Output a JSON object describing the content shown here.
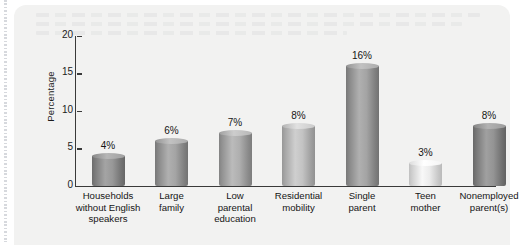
{
  "figure": {
    "panel_background": "#f2f2f1",
    "page_background": "#ffffff"
  },
  "chart_data": {
    "type": "bar",
    "title": "",
    "subtitle": "",
    "xlabel": "",
    "ylabel": "Percentage",
    "ylim": [
      0,
      20
    ],
    "yticks": [
      0,
      5,
      10,
      15,
      20
    ],
    "ytick_labels": [
      "0",
      "5",
      "10",
      "15",
      "20"
    ],
    "grid": false,
    "legend": null,
    "orientation": "vertical",
    "bar_style": "3d-cylinder",
    "categories": [
      "Households without English speakers",
      "Large family",
      "Low parental education",
      "Residential mobility",
      "Single parent",
      "Teen mother",
      "Nonemployed parent(s)"
    ],
    "category_lines": [
      [
        "Households",
        "without English",
        "speakers"
      ],
      [
        "Large",
        "family"
      ],
      [
        "Low",
        "parental",
        "education"
      ],
      [
        "Residential",
        "mobility"
      ],
      [
        "Single",
        "parent"
      ],
      [
        "Teen",
        "mother"
      ],
      [
        "Nonemployed",
        "parent(s)"
      ]
    ],
    "values": [
      4,
      6,
      7,
      8,
      16,
      3,
      8
    ],
    "data_labels": [
      "4%",
      "6%",
      "7%",
      "8%",
      "16%",
      "3%",
      "8%"
    ],
    "bar_colors": [
      "#8e8e8e",
      "#9a9a9a",
      "#a5a5a5",
      "#b9b9b9",
      "#9a9a9a",
      "#e2e2e2",
      "#8a8a8a"
    ]
  },
  "axis": {
    "y_title": "Percentage"
  }
}
